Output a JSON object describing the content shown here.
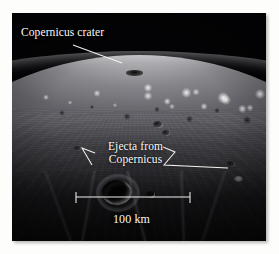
{
  "figure": {
    "type": "annotated-photograph",
    "background_color": "#fdfdfc",
    "photo_background_color": "#030305"
  },
  "annotations": {
    "crater_label": {
      "text": "Copernicus crater",
      "color": "#fbfbf8",
      "leader": "line-from-label-to-horizon-crater"
    },
    "ejecta_label": {
      "line1": "Ejecta from",
      "line2": "Copernicus",
      "color": "#fbfbf8",
      "leader_left": "angled-line-to-left-ejecta-ridge",
      "leader_right": "angled-line-to-right-ejecta-ridge"
    },
    "scale_bar": {
      "label": "100 km",
      "color": "#f2f2f0",
      "length_px": 114,
      "tick_style": "end-serifs"
    }
  },
  "icons": {
    "leader_line": "leader-line-icon",
    "scale_bar": "scale-bar-icon"
  },
  "features": {
    "horizon": "curved lunar limb across upper third",
    "highlands": "bright rugged mountainous terrain along the limb",
    "foreground": "dark shadowed ejecta plain with radial streaks",
    "main_crater": "bright-rimmed crater in lower-left foreground"
  }
}
